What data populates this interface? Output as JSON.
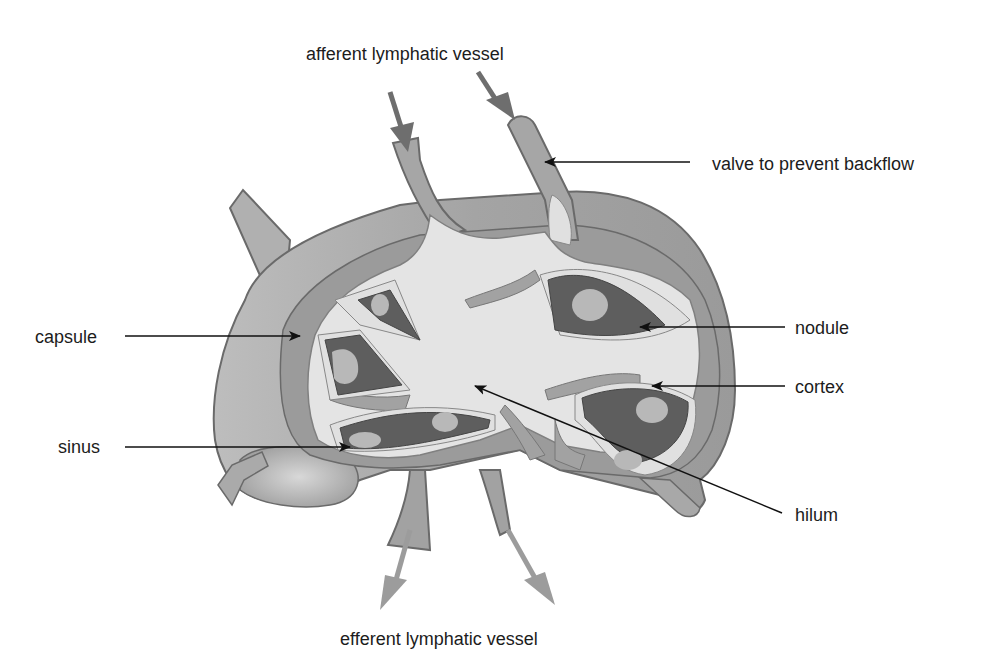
{
  "labels": {
    "afferent": "afferent lymphatic vessel",
    "valve": "valve to prevent backflow",
    "capsule": "capsule",
    "nodule": "nodule",
    "cortex": "cortex",
    "sinus": "sinus",
    "hilum": "hilum",
    "efferent": "efferent lymphatic vessel"
  },
  "colors": {
    "outer_capsule": "#a9a9a9",
    "capsule_band": "#9a9a9a",
    "outline": "#6a6a6a",
    "medulla_light": "#e6e6e6",
    "cortex_light": "#dcdcdc",
    "nodule_dark": "#5e5e5e",
    "germinal_center": "#b8b8b8",
    "flow_arrow": "#6e6e6e",
    "efferent_arrow": "#9c9c9c",
    "leader_line": "#111111"
  }
}
